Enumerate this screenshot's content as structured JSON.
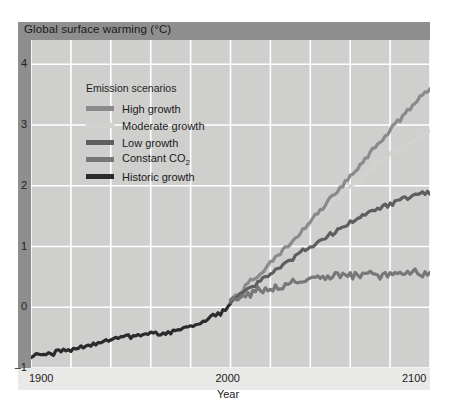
{
  "figure": {
    "title": "Global surface warming (°C)",
    "colors": {
      "panel_background": "#e9e9e7",
      "title_bar": "#8e8e8e",
      "left_band": "#8e8e8e",
      "plot_background": "#cfcfcd",
      "gridline": "#ffffff"
    }
  },
  "legend": {
    "title": "Emission scenarios",
    "position": "inside-upper-left",
    "items": [
      {
        "label": "High growth",
        "color": "#8a8a8a"
      },
      {
        "label": "Moderate growth",
        "color": "#d2d2d0"
      },
      {
        "label": "Low growth",
        "color": "#5e5e5e"
      },
      {
        "label": "Constant CO2",
        "label_main": "Constant CO",
        "label_sub": "2",
        "color": "#777777"
      },
      {
        "label": "Historic growth",
        "color": "#2b2b2b"
      }
    ]
  },
  "axes": {
    "y_ticks": [
      "4",
      "3",
      "2",
      "1",
      "0",
      "–1"
    ],
    "x_ticks": [
      "1900",
      "2000",
      "2100"
    ],
    "x_label": "Year"
  },
  "chart_data": {
    "type": "line",
    "title": "Global surface warming (°C)",
    "xlabel": "Year",
    "ylabel": "Global surface warming (°C)",
    "xlim": [
      1900,
      2100
    ],
    "ylim": [
      -1,
      4.4
    ],
    "grid": true,
    "x_tick_values": [
      1900,
      2000,
      2100
    ],
    "x_gridline_values": [
      1900,
      1920,
      1940,
      1960,
      1980,
      2000,
      2020,
      2040,
      2060,
      2080,
      2100
    ],
    "y_tick_values": [
      4,
      3,
      2,
      1,
      0,
      -1
    ],
    "legend_position": "inside-upper-left",
    "series": [
      {
        "name": "Historic growth",
        "color": "#2b2b2b",
        "x": [
          1900,
          1905,
          1910,
          1915,
          1920,
          1925,
          1930,
          1935,
          1940,
          1945,
          1950,
          1955,
          1960,
          1965,
          1970,
          1975,
          1980,
          1985,
          1990,
          1995,
          2000
        ],
        "y": [
          -0.78,
          -0.8,
          -0.76,
          -0.72,
          -0.7,
          -0.66,
          -0.62,
          -0.58,
          -0.52,
          -0.5,
          -0.48,
          -0.44,
          -0.42,
          -0.46,
          -0.4,
          -0.38,
          -0.3,
          -0.26,
          -0.14,
          -0.1,
          0.05
        ]
      },
      {
        "name": "High growth",
        "color": "#8a8a8a",
        "x": [
          2000,
          2010,
          2020,
          2030,
          2040,
          2050,
          2060,
          2070,
          2080,
          2090,
          2100
        ],
        "y": [
          0.12,
          0.42,
          0.72,
          1.05,
          1.4,
          1.78,
          2.15,
          2.55,
          2.92,
          3.28,
          3.6
        ]
      },
      {
        "name": "Moderate growth",
        "color": "#d2d2d0",
        "x": [
          2000,
          2010,
          2020,
          2030,
          2040,
          2050,
          2060,
          2070,
          2080,
          2090,
          2100
        ],
        "y": [
          0.12,
          0.4,
          0.7,
          1.02,
          1.35,
          1.68,
          1.98,
          2.25,
          2.5,
          2.72,
          2.9
        ]
      },
      {
        "name": "Low growth",
        "color": "#5e5e5e",
        "x": [
          2000,
          2010,
          2020,
          2030,
          2040,
          2050,
          2060,
          2070,
          2080,
          2090,
          2100
        ],
        "y": [
          0.1,
          0.32,
          0.55,
          0.78,
          1.0,
          1.2,
          1.4,
          1.57,
          1.7,
          1.82,
          1.9
        ]
      },
      {
        "name": "Constant CO2",
        "color": "#777777",
        "x": [
          2000,
          2010,
          2020,
          2030,
          2040,
          2050,
          2060,
          2070,
          2080,
          2090,
          2100
        ],
        "y": [
          0.1,
          0.22,
          0.32,
          0.4,
          0.46,
          0.5,
          0.52,
          0.53,
          0.54,
          0.55,
          0.55
        ]
      }
    ]
  }
}
